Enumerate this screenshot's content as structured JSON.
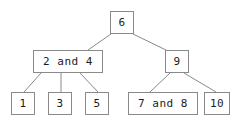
{
  "diagram": {
    "type": "tree",
    "background_color": "#ffffff",
    "border_color": "#8a8a8a",
    "edge_color": "#8a8a8a",
    "text_color": "#1b1b1b",
    "width": 242,
    "height": 124,
    "nodes": [
      {
        "id": "root",
        "label": "6",
        "x": 110,
        "y": 11,
        "w": 24,
        "h": 23,
        "level": 0
      },
      {
        "id": "left",
        "label": "2 and 4",
        "x": 33,
        "y": 50,
        "w": 70,
        "h": 23,
        "level": 1
      },
      {
        "id": "right",
        "label": "9",
        "x": 165,
        "y": 50,
        "w": 24,
        "h": 23,
        "level": 1
      },
      {
        "id": "leaf1",
        "label": "1",
        "x": 11,
        "y": 92,
        "w": 24,
        "h": 23,
        "level": 2
      },
      {
        "id": "leaf3",
        "label": "3",
        "x": 48,
        "y": 92,
        "w": 24,
        "h": 23,
        "level": 2
      },
      {
        "id": "leaf5",
        "label": "5",
        "x": 85,
        "y": 92,
        "w": 24,
        "h": 23,
        "level": 2
      },
      {
        "id": "leaf78",
        "label": "7 and 8",
        "x": 128,
        "y": 92,
        "w": 70,
        "h": 23,
        "level": 2
      },
      {
        "id": "leaf10",
        "label": "10",
        "x": 204,
        "y": 92,
        "w": 26,
        "h": 23,
        "level": 2
      }
    ],
    "edges": [
      {
        "id": "root-left",
        "from": "root",
        "to": "left",
        "x1": 111,
        "y1": 34,
        "x2": 88,
        "y2": 50
      },
      {
        "id": "root-right",
        "from": "root",
        "to": "right",
        "x1": 133,
        "y1": 34,
        "x2": 166,
        "y2": 50
      },
      {
        "id": "left-leaf1",
        "from": "left",
        "to": "leaf1",
        "x1": 41,
        "y1": 73,
        "x2": 24,
        "y2": 92
      },
      {
        "id": "left-leaf3",
        "from": "left",
        "to": "leaf3",
        "x1": 61,
        "y1": 73,
        "x2": 61,
        "y2": 92
      },
      {
        "id": "left-leaf5",
        "from": "left",
        "to": "leaf5",
        "x1": 80,
        "y1": 73,
        "x2": 98,
        "y2": 92
      },
      {
        "id": "right-leaf78",
        "from": "right",
        "to": "leaf78",
        "x1": 170,
        "y1": 73,
        "x2": 150,
        "y2": 92
      },
      {
        "id": "right-leaf10",
        "from": "right",
        "to": "leaf10",
        "x1": 184,
        "y1": 73,
        "x2": 216,
        "y2": 92
      }
    ]
  }
}
